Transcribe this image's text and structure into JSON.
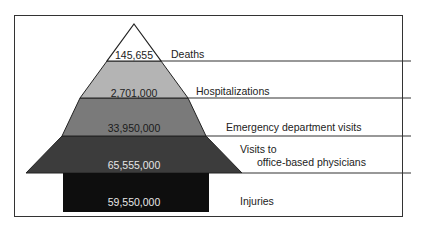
{
  "diagram": {
    "type": "injury pyramid",
    "levels": [
      {
        "value": "145,655",
        "label": "Deaths",
        "fill": "#ffffff",
        "text_color": "#222222"
      },
      {
        "value": "2,701,000",
        "label": "Hospitalizations",
        "fill": "#b4b4b4",
        "text_color": "#222222"
      },
      {
        "value": "33,950,000",
        "label": "Emergency department visits",
        "fill": "#7a7a7a",
        "text_color": "#1a1a1a"
      },
      {
        "value": "65,555,000",
        "label_line1": "Visits to",
        "label_line2": "office-based physicians",
        "fill": "#3c3c3c",
        "text_color": "#e6e6e6"
      },
      {
        "value": "59,550,000",
        "label": "Injuries",
        "fill": "#0e0e0e",
        "text_color": "#e6e6e6"
      }
    ]
  }
}
